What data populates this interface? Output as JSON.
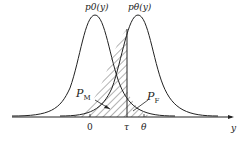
{
  "diagram": {
    "curve_left_label": "p0(y)",
    "curve_right_label": "pθ(y)",
    "miss_label": "P",
    "miss_sub": "M",
    "false_label": "P",
    "false_sub": "F",
    "tick_zero": "0",
    "tick_tau": "τ",
    "tick_theta": "θ",
    "axis_label": "y"
  }
}
